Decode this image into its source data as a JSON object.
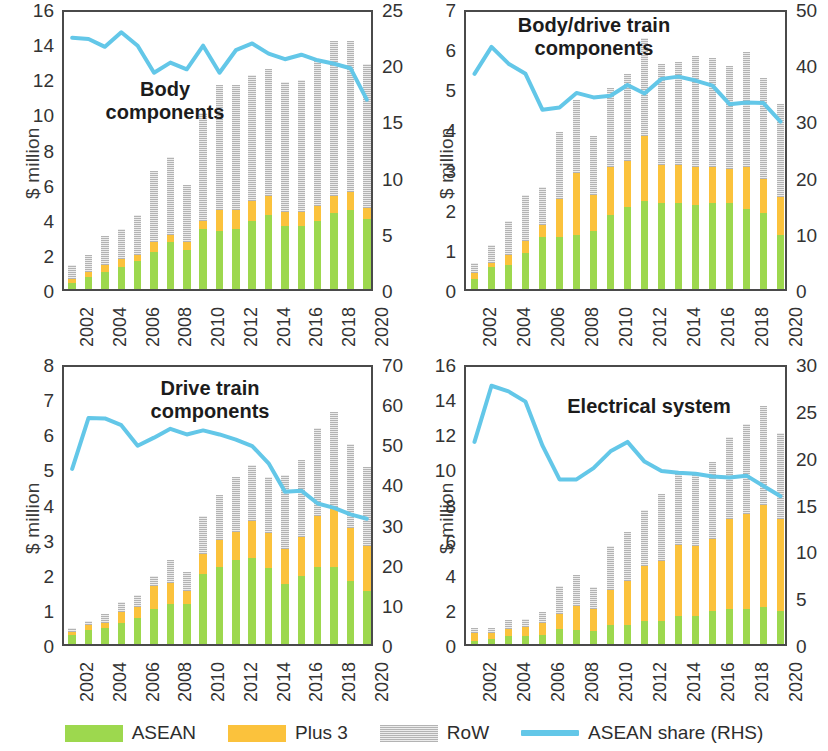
{
  "colors": {
    "asean": "#9dd84e",
    "plus3": "#fbc23c",
    "row": "#b3b3b3",
    "line": "#63c7e8",
    "axis": "#4a4a4a",
    "text": "#2b2b2b"
  },
  "legend": {
    "items": [
      {
        "key": "asean",
        "label": "ASEAN",
        "type": "swatch"
      },
      {
        "key": "plus3",
        "label": "Plus 3",
        "type": "swatch"
      },
      {
        "key": "row",
        "label": "RoW",
        "type": "swatch"
      },
      {
        "key": "line",
        "label": "ASEAN share (RHS)",
        "type": "line"
      }
    ]
  },
  "axis_label": "$ million",
  "years": [
    2002,
    2003,
    2004,
    2005,
    2006,
    2007,
    2008,
    2009,
    2010,
    2011,
    2012,
    2013,
    2014,
    2015,
    2016,
    2017,
    2018,
    2019,
    2020
  ],
  "xtick_labels": [
    "2002",
    "2004",
    "2006",
    "2008",
    "2010",
    "2012",
    "2014",
    "2016",
    "2018",
    "2020"
  ],
  "chart_data": [
    {
      "id": "body-components",
      "type": "bar",
      "title": "Body\ncomponents",
      "xlabel": "",
      "ylabel": "$ million",
      "ylim": [
        0,
        16
      ],
      "yticks": [
        0,
        2,
        4,
        6,
        8,
        10,
        12,
        14,
        16
      ],
      "y2lim": [
        0,
        25
      ],
      "y2ticks": [
        0,
        5,
        10,
        15,
        20,
        25
      ],
      "y2label": "",
      "grid": false,
      "legend_position": "bottom",
      "categories": [
        2002,
        2003,
        2004,
        2005,
        2006,
        2007,
        2008,
        2009,
        2010,
        2011,
        2012,
        2013,
        2014,
        2015,
        2016,
        2017,
        2018,
        2019,
        2020
      ],
      "series": [
        {
          "name": "ASEAN",
          "values": [
            0.35,
            0.7,
            0.95,
            1.25,
            1.6,
            2.1,
            2.7,
            2.2,
            3.4,
            3.3,
            3.4,
            3.9,
            4.2,
            3.6,
            3.6,
            3.9,
            4.3,
            4.5,
            4.0
          ]
        },
        {
          "name": "Plus 3",
          "values": [
            0.2,
            0.25,
            0.4,
            0.45,
            0.35,
            0.6,
            0.4,
            0.5,
            0.45,
            1.2,
            1.1,
            1.1,
            1.1,
            0.8,
            0.8,
            0.8,
            1.0,
            1.0,
            0.6
          ]
        },
        {
          "name": "RoW",
          "values": [
            0.8,
            1.0,
            1.65,
            1.7,
            2.25,
            4.0,
            4.4,
            3.2,
            6.15,
            7.1,
            7.1,
            7.2,
            7.2,
            7.4,
            7.5,
            8.4,
            8.8,
            8.6,
            8.2
          ]
        }
      ],
      "line_series": {
        "name": "ASEAN share (RHS)",
        "values": [
          22.7,
          22.6,
          21.9,
          23.2,
          22.0,
          19.6,
          20.5,
          19.9,
          22.0,
          19.6,
          21.6,
          22.2,
          21.3,
          20.8,
          21.2,
          20.7,
          20.4,
          20.0,
          17.2
        ]
      }
    },
    {
      "id": "body-drive-train-components",
      "type": "bar",
      "title": "Body/drive train\ncomponents",
      "xlabel": "",
      "ylabel": "$ million",
      "ylim": [
        0,
        7
      ],
      "yticks": [
        0,
        1,
        2,
        3,
        4,
        5,
        6,
        7
      ],
      "y2lim": [
        0,
        50
      ],
      "y2ticks": [
        0,
        10,
        20,
        30,
        40,
        50
      ],
      "y2label": "",
      "grid": false,
      "legend_position": "bottom",
      "categories": [
        2002,
        2003,
        2004,
        2005,
        2006,
        2007,
        2008,
        2009,
        2010,
        2011,
        2012,
        2013,
        2014,
        2015,
        2016,
        2017,
        2018,
        2019,
        2020
      ],
      "series": [
        {
          "name": "ASEAN",
          "values": [
            0.25,
            0.55,
            0.6,
            0.9,
            1.3,
            1.3,
            1.35,
            1.45,
            1.85,
            2.05,
            2.2,
            2.15,
            2.15,
            2.1,
            2.15,
            2.15,
            2.0,
            1.9,
            1.35
          ]
        },
        {
          "name": "Plus 3",
          "values": [
            0.15,
            0.1,
            0.25,
            0.3,
            0.3,
            0.95,
            1.55,
            0.9,
            1.2,
            1.15,
            1.6,
            0.95,
            0.95,
            0.95,
            0.9,
            0.85,
            1.05,
            0.85,
            0.95
          ]
        },
        {
          "name": "RoW",
          "values": [
            0.25,
            0.45,
            0.85,
            1.15,
            0.95,
            1.65,
            1.8,
            1.45,
            1.95,
            2.15,
            2.45,
            2.5,
            2.55,
            2.75,
            2.7,
            2.55,
            2.85,
            2.5,
            2.3
          ]
        }
      ],
      "line_series": {
        "name": "ASEAN share (RHS)",
        "values": [
          39.0,
          43.8,
          40.8,
          39.0,
          32.6,
          33.0,
          35.6,
          34.8,
          35.1,
          37.0,
          35.5,
          38.1,
          38.5,
          37.8,
          36.9,
          33.6,
          33.9,
          33.8,
          30.5
        ]
      }
    },
    {
      "id": "drive-train-components",
      "type": "bar",
      "title": "Drive train\ncomponents",
      "xlabel": "",
      "ylabel": "$ million",
      "ylim": [
        0,
        8
      ],
      "yticks": [
        0,
        1,
        2,
        3,
        4,
        5,
        6,
        7,
        8
      ],
      "y2lim": [
        0,
        70
      ],
      "y2ticks": [
        0,
        10,
        20,
        30,
        40,
        50,
        60,
        70
      ],
      "y2label": "",
      "grid": false,
      "legend_position": "bottom",
      "categories": [
        2002,
        2003,
        2004,
        2005,
        2006,
        2007,
        2008,
        2009,
        2010,
        2011,
        2012,
        2013,
        2014,
        2015,
        2016,
        2017,
        2018,
        2019,
        2020
      ],
      "series": [
        {
          "name": "ASEAN",
          "values": [
            0.25,
            0.4,
            0.45,
            0.6,
            0.75,
            1.0,
            1.15,
            1.15,
            2.0,
            2.2,
            2.4,
            2.45,
            2.15,
            1.7,
            1.95,
            2.2,
            2.2,
            1.8,
            1.5
          ]
        },
        {
          "name": "Plus 3",
          "values": [
            0.1,
            0.15,
            0.15,
            0.3,
            0.3,
            0.65,
            0.6,
            0.35,
            0.55,
            0.75,
            0.8,
            1.05,
            1.0,
            1.0,
            1.1,
            1.45,
            1.7,
            1.5,
            1.3
          ]
        },
        {
          "name": "RoW",
          "values": [
            0.1,
            0.1,
            0.25,
            0.3,
            0.35,
            0.3,
            0.65,
            0.55,
            1.1,
            1.3,
            1.55,
            1.6,
            1.6,
            2.1,
            2.2,
            2.5,
            2.7,
            2.4,
            2.25
          ]
        }
      ],
      "line_series": {
        "name": "ASEAN share (RHS)",
        "values": [
          44.6,
          57.3,
          57.2,
          55.5,
          50.4,
          52.4,
          54.6,
          53.2,
          54.2,
          53.2,
          51.9,
          50.3,
          46.0,
          38.9,
          39.2,
          36.0,
          34.9,
          33.3,
          32.2
        ]
      }
    },
    {
      "id": "electrical-system",
      "type": "bar",
      "title": "Electrical system",
      "xlabel": "",
      "ylabel": "$ million",
      "ylim": [
        0,
        16
      ],
      "yticks": [
        0,
        2,
        4,
        6,
        8,
        10,
        12,
        14,
        16
      ],
      "y2lim": [
        0,
        30
      ],
      "y2ticks": [
        0,
        5,
        10,
        15,
        20,
        25,
        30
      ],
      "y2label": "",
      "grid": false,
      "legend_position": "bottom",
      "categories": [
        2002,
        2003,
        2004,
        2005,
        2006,
        2007,
        2008,
        2009,
        2010,
        2011,
        2012,
        2013,
        2014,
        2015,
        2016,
        2017,
        2018,
        2019,
        2020
      ],
      "series": [
        {
          "name": "ASEAN",
          "values": [
            0.2,
            0.3,
            0.45,
            0.45,
            0.5,
            0.85,
            0.8,
            0.75,
            1.1,
            1.1,
            1.3,
            1.3,
            1.6,
            1.6,
            1.9,
            2.0,
            2.0,
            2.1,
            1.9
          ]
        },
        {
          "name": "Plus 3",
          "values": [
            0.45,
            0.35,
            0.4,
            0.5,
            0.7,
            0.85,
            1.35,
            1.25,
            2.0,
            2.5,
            3.15,
            3.4,
            4.05,
            4.0,
            4.1,
            5.1,
            5.4,
            5.8,
            5.2
          ]
        },
        {
          "name": "RoW",
          "values": [
            0.25,
            0.25,
            0.5,
            0.45,
            0.6,
            1.6,
            1.8,
            1.25,
            2.5,
            2.8,
            3.2,
            3.85,
            4.05,
            4.2,
            4.35,
            4.7,
            5.1,
            5.65,
            4.9
          ]
        }
      ],
      "line_series": {
        "name": "ASEAN share (RHS)",
        "values": [
          22.0,
          28.0,
          27.4,
          26.3,
          21.6,
          18.0,
          18.0,
          19.2,
          21.0,
          22.0,
          19.9,
          18.9,
          18.7,
          18.6,
          18.3,
          18.2,
          18.4,
          17.3,
          16.2
        ]
      }
    }
  ]
}
